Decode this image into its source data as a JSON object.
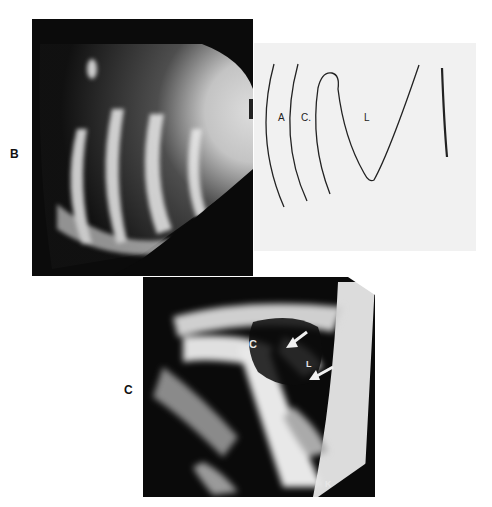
{
  "figure": {
    "panels": [
      {
        "id": "B",
        "label": "B",
        "type": "ultrasound-image",
        "diagram_labels": [
          "A",
          "C",
          "L"
        ]
      },
      {
        "id": "C",
        "label": "C",
        "type": "ultrasound-image",
        "image_labels": [
          "C",
          "L",
          "K"
        ]
      }
    ],
    "diagram": {
      "label_a": "A",
      "label_c": "C.",
      "label_l": "L"
    },
    "panel_c_labels": {
      "c": "C",
      "l": "L",
      "k": "K"
    }
  }
}
